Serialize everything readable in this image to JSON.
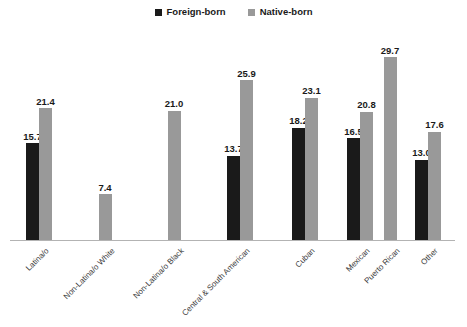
{
  "legend": {
    "entries": [
      {
        "label": "Foreign-born",
        "color": "#1a1a1a",
        "icon": "square-marker-icon"
      },
      {
        "label": "Native-born",
        "color": "#999999",
        "icon": "square-marker-icon"
      }
    ]
  },
  "axis": {
    "baseline_color": "#b3b3b3"
  },
  "chart_data": {
    "type": "bar",
    "title": "",
    "subtitle": "",
    "xlabel": "",
    "ylabel": "",
    "ylim": [
      0,
      31
    ],
    "grid": false,
    "legend_position": "top-center",
    "categories": [
      "Latina/o",
      "Non-Latina/o White",
      "Non-Latina/o Black",
      "Central & South American",
      "Cuban",
      "Mexican",
      "Puerto Rican",
      "Other"
    ],
    "series": [
      {
        "name": "Foreign-born",
        "color": "#1a1a1a",
        "values": [
          15.7,
          null,
          null,
          13.7,
          18.2,
          16.5,
          null,
          13.0
        ]
      },
      {
        "name": "Native-born",
        "color": "#999999",
        "values": [
          21.4,
          7.4,
          21.0,
          25.9,
          23.1,
          20.8,
          29.7,
          17.6
        ]
      }
    ],
    "data_labels": [
      {
        "category": "Latina/o",
        "series": "Foreign-born",
        "text": "15.7"
      },
      {
        "category": "Latina/o",
        "series": "Native-born",
        "text": "21.4"
      },
      {
        "category": "Non-Latina/o White",
        "series": "Native-born",
        "text": "7.4"
      },
      {
        "category": "Non-Latina/o Black",
        "series": "Native-born",
        "text": "21.0"
      },
      {
        "category": "Central & South American",
        "series": "Foreign-born",
        "text": "13.7"
      },
      {
        "category": "Central & South American",
        "series": "Native-born",
        "text": "25.9"
      },
      {
        "category": "Cuban",
        "series": "Foreign-born",
        "text": "18.2"
      },
      {
        "category": "Cuban",
        "series": "Native-born",
        "text": "23.1"
      },
      {
        "category": "Mexican",
        "series": "Foreign-born",
        "text": "16.5"
      },
      {
        "category": "Mexican",
        "series": "Native-born",
        "text": "20.8"
      },
      {
        "category": "Puerto Rican",
        "series": "Native-born",
        "text": "29.7"
      },
      {
        "category": "Other",
        "series": "Foreign-born",
        "text": "13.0"
      },
      {
        "category": "Other",
        "series": "Native-born",
        "text": "17.6"
      }
    ]
  },
  "layout": {
    "plot_left": 10,
    "plot_width": 445,
    "baseline_y": 210,
    "px_per_unit": 6.16,
    "bar_width": 13,
    "group_centers": [
      39,
      105,
      174,
      240,
      305,
      360,
      390,
      428
    ]
  }
}
